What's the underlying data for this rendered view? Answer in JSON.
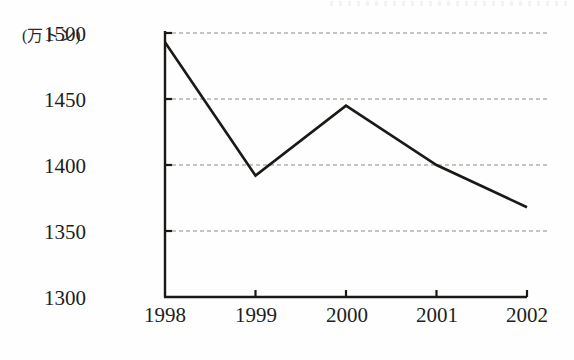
{
  "chart_data": {
    "type": "line",
    "title": "",
    "subtitle": "",
    "xlabel": "",
    "ylabel": "",
    "unit_label": "(万トン)",
    "categories": [
      "1998",
      "1999",
      "2000",
      "2001",
      "2002"
    ],
    "values": [
      1493,
      1392,
      1445,
      1400,
      1368
    ],
    "series": [
      {
        "name": "",
        "values": [
          1493,
          1392,
          1445,
          1400,
          1368
        ]
      }
    ],
    "ylim": [
      1300,
      1500
    ],
    "yticks": [
      "1300",
      "1350",
      "1400",
      "1450",
      "1500"
    ],
    "ytick_values": [
      1300,
      1350,
      1400,
      1450,
      1500
    ],
    "xticks": [
      "1998",
      "1999",
      "2000",
      "2001",
      "2002"
    ],
    "grid": "horizontal-dashed",
    "legend": "none",
    "line_color": "#1b1816",
    "grid_color": "#8b8b80",
    "axis_color": "#1b1816",
    "background_color": "#fefefe",
    "markers": "none"
  }
}
